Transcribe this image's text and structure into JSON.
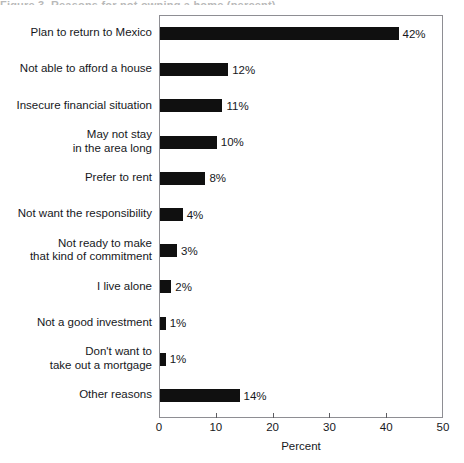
{
  "figure": {
    "title_remnant": "Figure 3. Reasons for not owning a home (percent)",
    "background_color": "#ffffff",
    "bar_color": "#101010",
    "frame_color": "#8e8e93",
    "text_color": "#16181c"
  },
  "chart_data": {
    "type": "bar",
    "orientation": "horizontal",
    "title": "",
    "xlabel": "Percent",
    "ylabel": "",
    "xlim": [
      0,
      50
    ],
    "xticks": [
      0,
      10,
      20,
      30,
      40,
      50
    ],
    "xtick_labels": [
      "0",
      "10",
      "20",
      "30",
      "40",
      "50"
    ],
    "grid": false,
    "legend": null,
    "categories": [
      "Plan to return to Mexico",
      "Not able to afford a house",
      "Insecure financial situation",
      "May not stay\nin the area long",
      "Prefer to rent",
      "Not want the responsibility",
      "Not ready to make\nthat kind of commitment",
      "I live alone",
      "Not a good investment",
      "Don't want to\ntake out a mortgage",
      "Other reasons"
    ],
    "values": [
      42,
      12,
      11,
      10,
      8,
      4,
      3,
      2,
      1,
      1,
      14
    ],
    "data_labels": [
      "42%",
      "12%",
      "11%",
      "10%",
      "8%",
      "4%",
      "3%",
      "2%",
      "1%",
      "1%",
      "14%"
    ]
  }
}
